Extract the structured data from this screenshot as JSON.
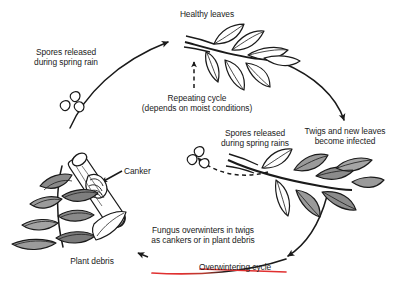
{
  "diagram": {
    "labels": {
      "healthy_leaves": "Healthy leaves",
      "spores_released_spring_rain": "Spores released\nduring spring rain",
      "repeating_cycle": "Repeating cycle\n(depends on moist conditions)",
      "spores_released_spring_rains": "Spores released\nduring spring rains",
      "twigs_new_leaves": "Twigs and new leaves\nbecome infected",
      "canker": "Canker",
      "fungus_overwinters": "Fungus overwinters in twigs\nas cankers or in plant debris",
      "plant_debris": "Plant debris",
      "overwintering_cycle": "Overwintering cycle"
    },
    "colors": {
      "ink": "#1a1a1a",
      "accent_red": "#e03030",
      "leaf_fill_light": "#ffffff",
      "leaf_fill_dark": "#6e6e6e",
      "background": "#ffffff"
    },
    "elements": {
      "arcs": [
        "left-ascending-arc",
        "top-right-descending-arc",
        "bottom-right-descending-arc",
        "bottom-leftward-arc"
      ],
      "dashed_arrows": [
        "repeating-cycle-up-arrow",
        "spores-release-curved-arrow"
      ],
      "illustrations": [
        "healthy-leaf-branch",
        "infected-leaf-branch",
        "cankered-twig",
        "fallen-leaf-debris",
        "spore-cluster-left",
        "spore-cluster-middle"
      ]
    }
  }
}
